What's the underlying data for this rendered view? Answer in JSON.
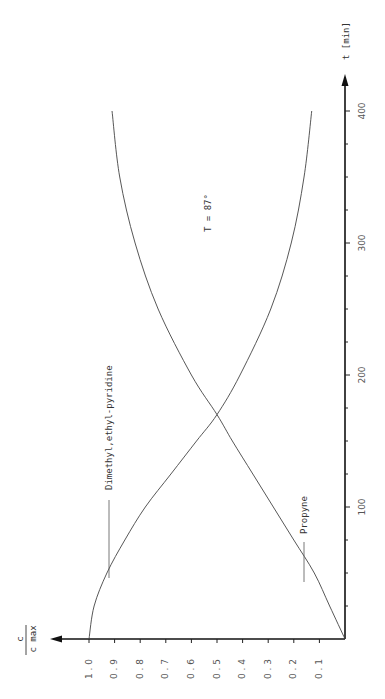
{
  "chart_data": {
    "type": "line",
    "orientation": "rotated-90-ccw",
    "title": "",
    "annotation": "T = 87°",
    "xlabel": "t [min]",
    "ylabel_numerator": "c",
    "ylabel_denominator": "c max",
    "xlim": [
      0,
      400
    ],
    "ylim": [
      0,
      1.0
    ],
    "x_ticks": [
      100,
      200,
      300,
      400
    ],
    "x_minor_step": 25,
    "y_ticks": [
      "0.1",
      "0.2",
      "0.3",
      "0.4",
      "0.5",
      "0.6",
      "0.7",
      "0.8",
      "0.9",
      "1.0"
    ],
    "grid": false,
    "series": [
      {
        "name": "Dimethyl,ethyl-pyridine",
        "x": [
          0,
          25,
          50,
          75,
          100,
          125,
          150,
          170,
          200,
          250,
          300,
          350,
          400
        ],
        "values": [
          1.0,
          0.98,
          0.93,
          0.86,
          0.78,
          0.68,
          0.58,
          0.5,
          0.41,
          0.29,
          0.21,
          0.16,
          0.13
        ],
        "label_at_x": 70
      },
      {
        "name": "Propyne",
        "x": [
          0,
          25,
          50,
          75,
          100,
          125,
          150,
          170,
          200,
          250,
          300,
          350,
          400
        ],
        "values": [
          0.0,
          0.06,
          0.12,
          0.2,
          0.28,
          0.36,
          0.44,
          0.5,
          0.6,
          0.73,
          0.82,
          0.88,
          0.91
        ],
        "label_at_x": 80
      }
    ]
  }
}
